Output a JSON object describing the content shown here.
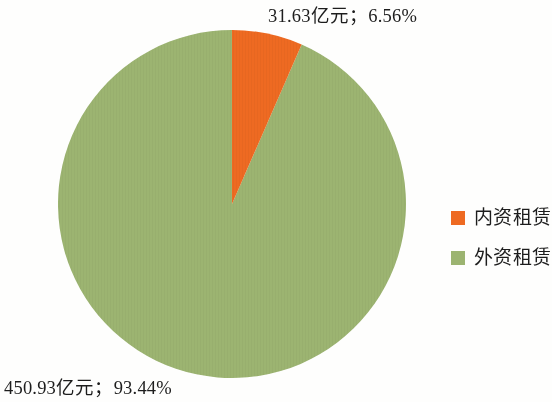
{
  "chart_data": {
    "type": "pie",
    "title": "",
    "categories": [
      "内资租赁",
      "外资租赁"
    ],
    "values": [
      31.63,
      450.93
    ],
    "value_unit": "亿元",
    "percentages": [
      6.56,
      93.44
    ],
    "colors": [
      "#ee6a22",
      "#9cb471"
    ],
    "legend_position": "right",
    "start_angle_deg": 0,
    "direction": "clockwise",
    "slices": [
      {
        "name": "内资租赁",
        "value": 31.63,
        "percent": 6.56,
        "color": "#ee6a22",
        "label": "31.63亿元；6.56%"
      },
      {
        "name": "外资租赁",
        "value": 450.93,
        "percent": 93.44,
        "color": "#9cb471",
        "label": "450.93亿元；93.44%"
      }
    ],
    "data_labels": {
      "domestic": "31.63亿元；6.56%",
      "foreign": "450.93亿元；93.44%"
    }
  },
  "legend": {
    "items": [
      {
        "label": "内资租赁",
        "color": "#ee6a22"
      },
      {
        "label": "外资租赁",
        "color": "#9cb471"
      }
    ]
  },
  "colors": {
    "domestic": "#ee6a22",
    "foreign": "#9cb471",
    "background": "#fefefd",
    "text": "#1d1d1d"
  }
}
